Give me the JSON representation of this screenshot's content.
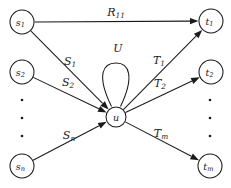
{
  "figure": {
    "type": "directed-graph",
    "background_color": "#ffffff",
    "ink_color": "#1a1a1a",
    "width": 231,
    "height": 188
  },
  "nodes": [
    {
      "id": "s1",
      "label": "s",
      "sub": "1",
      "x": 22,
      "y": 22,
      "r": 12,
      "role": "source"
    },
    {
      "id": "s2",
      "label": "s",
      "sub": "2",
      "x": 22,
      "y": 72,
      "r": 12,
      "role": "source"
    },
    {
      "id": "sn",
      "label": "s",
      "sub": "n",
      "x": 22,
      "y": 166,
      "r": 12,
      "role": "source"
    },
    {
      "id": "u",
      "label": "u",
      "sub": "",
      "x": 116,
      "y": 117,
      "r": 10,
      "role": "hub"
    },
    {
      "id": "t1",
      "label": "t",
      "sub": "1",
      "x": 211,
      "y": 21,
      "r": 12,
      "role": "target"
    },
    {
      "id": "t2",
      "label": "t",
      "sub": "2",
      "x": 211,
      "y": 72,
      "r": 12,
      "role": "target"
    },
    {
      "id": "tm",
      "label": "t",
      "sub": "m",
      "x": 210,
      "y": 166,
      "r": 12,
      "role": "target"
    }
  ],
  "edges": [
    {
      "id": "e-s1-t1",
      "from": "s1",
      "to": "t1",
      "label": "R",
      "sub": "11",
      "label_x": 116,
      "label_y": 12
    },
    {
      "id": "e-s1-u",
      "from": "s1",
      "to": "u",
      "label": "S",
      "sub": "1",
      "label_x": 70,
      "label_y": 61
    },
    {
      "id": "e-s2-u",
      "from": "s2",
      "to": "u",
      "label": "S",
      "sub": "2",
      "label_x": 68,
      "label_y": 82
    },
    {
      "id": "e-sn-u",
      "from": "sn",
      "to": "u",
      "label": "S",
      "sub": "n",
      "label_x": 69,
      "label_y": 135
    },
    {
      "id": "e-u-t1",
      "from": "u",
      "to": "t1",
      "label": "T",
      "sub": "1",
      "label_x": 159,
      "label_y": 60
    },
    {
      "id": "e-u-t2",
      "from": "u",
      "to": "t2",
      "label": "T",
      "sub": "2",
      "label_x": 160,
      "label_y": 83
    },
    {
      "id": "e-u-tm",
      "from": "u",
      "to": "tm",
      "label": "T",
      "sub": "m",
      "label_x": 161,
      "label_y": 133
    }
  ],
  "self_loop": {
    "id": "e-u-u",
    "node": "u",
    "label": "U",
    "label_x": 118,
    "label_y": 48
  },
  "ellipses": [
    {
      "id": "left-ellipsis",
      "x": 22,
      "dot_ys": [
        100,
        118,
        136
      ]
    },
    {
      "id": "right-ellipsis",
      "x": 210,
      "dot_ys": [
        100,
        118,
        136
      ]
    }
  ]
}
